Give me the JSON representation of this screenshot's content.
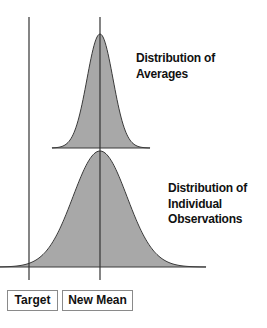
{
  "chart_data": {
    "type": "area",
    "title": "",
    "series": [
      {
        "name": "Distribution of Averages",
        "mean_x": 100,
        "sigma_px": 13,
        "peak_y": 34,
        "base_y": 148,
        "x_range": [
          52,
          150
        ],
        "relative_spread": "narrow"
      },
      {
        "name": "Distribution of Individual Observations",
        "mean_x": 100,
        "sigma_px": 27,
        "peak_y": 151,
        "base_y": 267,
        "x_range": [
          0,
          206
        ],
        "relative_spread": "wide"
      }
    ],
    "reference_lines": [
      {
        "name": "Target",
        "x": 29
      },
      {
        "name": "New Mean",
        "x": 100
      }
    ],
    "grid": false,
    "legend": "none"
  },
  "labels": {
    "averages": [
      "Distribution of",
      "Averages"
    ],
    "individuals": [
      "Distribution of",
      "Individual",
      "Observations"
    ],
    "target": "Target",
    "new_mean": "New Mean"
  },
  "colors": {
    "fill": "#a8a8a8",
    "outline": "#3a3a3a",
    "lines": "#333333"
  }
}
